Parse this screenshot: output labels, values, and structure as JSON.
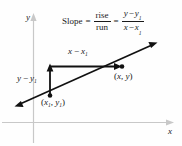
{
  "figure": {
    "axes": {
      "y_label": "y",
      "x_label": "x",
      "axis_color": "#c8c8c8"
    },
    "formula": {
      "lhs": "Slope",
      "equals_1": "=",
      "fraction_words": {
        "numerator": "rise",
        "denominator": "run"
      },
      "equals_2": "=",
      "fraction_vars": {
        "numerator_a": "y",
        "numerator_minus": "−",
        "numerator_b": "y",
        "numerator_b_sub": "1",
        "denominator_a": "x",
        "denominator_minus": "−",
        "denominator_b": "x",
        "denominator_b_sub": "1"
      }
    },
    "labels": {
      "run_segment": {
        "a": "x",
        "minus": "−",
        "b": "x",
        "b_sub": "1"
      },
      "rise_segment": {
        "a": "y",
        "minus": "−",
        "b": "y",
        "b_sub": "1"
      },
      "point_xy": {
        "open": "(",
        "x": "x",
        "comma": ", ",
        "y": "y",
        "close": ")"
      },
      "point_x1y1": {
        "open": "(",
        "x": "x",
        "x_sub": "1",
        "comma": ", ",
        "y": "y",
        "y_sub": "1",
        "close": ")"
      }
    },
    "colors": {
      "line": "#111111",
      "text": "#1a1a1a",
      "background": "#fefefe"
    }
  }
}
